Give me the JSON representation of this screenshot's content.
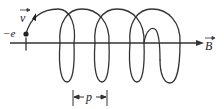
{
  "diagram": {
    "labels": {
      "charge": "−e",
      "velocity": "v",
      "field": "B",
      "pitch": "p"
    },
    "colors": {
      "stroke": "#333333",
      "background": "#ffffff"
    }
  }
}
